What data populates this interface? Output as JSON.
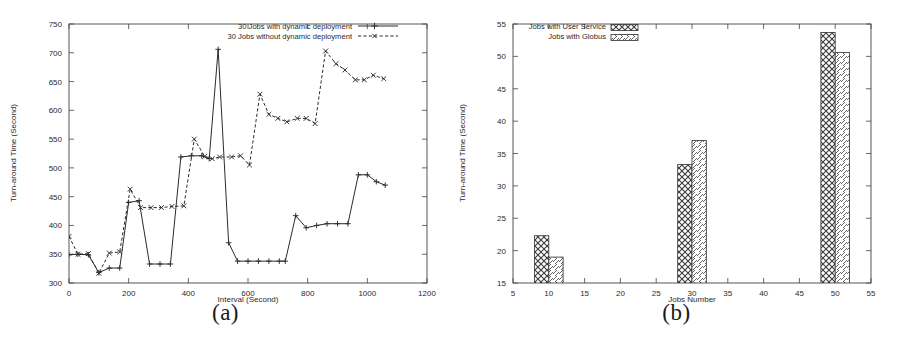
{
  "figure": {
    "subfigures": [
      {
        "caption": "(a)"
      },
      {
        "caption": "(b)"
      }
    ]
  },
  "chart_data": [
    {
      "type": "line",
      "id": "chart-a",
      "title": "",
      "xlabel": "Interval (Second)",
      "ylabel": "Turn-around Time (Second)",
      "xlim": [
        0,
        1200
      ],
      "ylim": [
        300,
        750
      ],
      "xticks": [
        0,
        200,
        400,
        600,
        800,
        1000,
        1200
      ],
      "yticks": [
        300,
        350,
        400,
        450,
        500,
        550,
        600,
        650,
        700,
        750
      ],
      "grid": false,
      "legend_position": "top-right",
      "series": [
        {
          "name": "30 Jobs with dynamic deployment",
          "line_style": "solid",
          "marker": "plus",
          "x": [
            0,
            30,
            65,
            100,
            135,
            170,
            200,
            235,
            270,
            305,
            340,
            375,
            410,
            445,
            470,
            500,
            535,
            565,
            600,
            635,
            670,
            705,
            725,
            760,
            795,
            830,
            865,
            900,
            935,
            970,
            1000,
            1030,
            1060
          ],
          "y": [
            349,
            350,
            349,
            318,
            326,
            326,
            440,
            443,
            333,
            333,
            333,
            519,
            521,
            521,
            516,
            706,
            370,
            338,
            338,
            338,
            338,
            338,
            338,
            417,
            396,
            400,
            403,
            403,
            403,
            488,
            488,
            476,
            470
          ]
        },
        {
          "name": "30 Jobs without dynamic deployment",
          "line_style": "dashed",
          "marker": "cross",
          "x": [
            0,
            30,
            65,
            100,
            135,
            170,
            205,
            240,
            275,
            310,
            345,
            385,
            420,
            455,
            480,
            505,
            545,
            575,
            605,
            640,
            670,
            700,
            730,
            765,
            795,
            825,
            860,
            895,
            925,
            960,
            990,
            1020,
            1055
          ],
          "y": [
            381,
            350,
            351,
            317,
            352,
            354,
            463,
            431,
            431,
            431,
            433,
            434,
            550,
            520,
            516,
            519,
            519,
            521,
            505,
            628,
            593,
            586,
            580,
            586,
            586,
            577,
            703,
            681,
            670,
            653,
            653,
            661,
            655
          ]
        }
      ]
    },
    {
      "type": "bar",
      "id": "chart-b",
      "title": "",
      "xlabel": "Jobs Number",
      "ylabel": "Turn-around Time (Second)",
      "xlim": [
        5,
        55
      ],
      "ylim": [
        15,
        55
      ],
      "xticks": [
        5,
        10,
        15,
        20,
        25,
        30,
        35,
        40,
        45,
        50,
        55
      ],
      "yticks": [
        15,
        20,
        25,
        30,
        35,
        40,
        45,
        50,
        55
      ],
      "grid": false,
      "legend_position": "top-left",
      "categories": [
        10,
        30,
        50
      ],
      "series": [
        {
          "name": "Jobs with User Service",
          "pattern": "crosshatch",
          "values": [
            22.3,
            33.3,
            53.7
          ]
        },
        {
          "name": "Jobs with Globus",
          "pattern": "diagonal",
          "values": [
            19.0,
            37.0,
            50.6
          ]
        }
      ]
    }
  ]
}
